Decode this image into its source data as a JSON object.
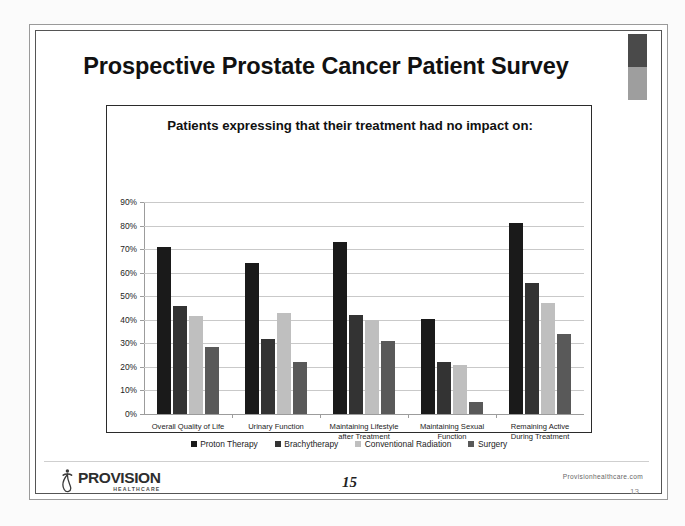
{
  "slide": {
    "title": "Prospective Prostate Cancer Patient Survey",
    "accent_dark_color": "#4a4a4a",
    "accent_light_color": "#9e9e9e"
  },
  "footer": {
    "logo_word": "PROVISION",
    "logo_sub": "HEALTHCARE",
    "page_number": "15",
    "site_url": "Provisionhealthcare.com",
    "slide_number": "13"
  },
  "chart_data": {
    "type": "bar",
    "title": "Patients expressing that their treatment had no impact on:",
    "xlabel": "",
    "ylabel": "",
    "ylim": [
      0,
      90
    ],
    "ytick_labels": [
      "0%",
      "10%",
      "20%",
      "30%",
      "40%",
      "50%",
      "60%",
      "70%",
      "80%",
      "90%"
    ],
    "ytick_values": [
      0,
      10,
      20,
      30,
      40,
      50,
      60,
      70,
      80,
      90
    ],
    "grid": true,
    "legend_position": "bottom",
    "categories": [
      "Overall Quality of Life",
      "Urinary Function",
      "Maintaining Lifestyle after Treatment",
      "Maintaining Sexual Function",
      "Remaining Active During Treatment"
    ],
    "category_lines": [
      [
        "Overall Quality of Life"
      ],
      [
        "Urinary Function"
      ],
      [
        "Maintaining Lifestyle",
        "after Treatment"
      ],
      [
        "Maintaining Sexual",
        "Function"
      ],
      [
        "Remaining Active",
        "During Treatment"
      ]
    ],
    "series": [
      {
        "name": "Proton Therapy",
        "color": "#1a1a1a",
        "values": [
          71,
          64,
          73,
          40.5,
          81
        ]
      },
      {
        "name": "Brachytherapy",
        "color": "#333333",
        "values": [
          46,
          32,
          42,
          22,
          55.5
        ]
      },
      {
        "name": "Conventional Radiation",
        "color": "#bfbfbf",
        "values": [
          41.5,
          43,
          40,
          21,
          47
        ]
      },
      {
        "name": "Surgery",
        "color": "#595959",
        "values": [
          28.5,
          22,
          31,
          5,
          34
        ]
      }
    ]
  }
}
